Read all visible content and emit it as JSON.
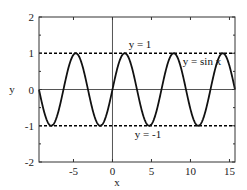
{
  "chart_data": {
    "type": "line",
    "title": "",
    "xlabel": "x",
    "ylabel": "y",
    "xlim": [
      -9.42,
      15.71
    ],
    "ylim": [
      -2,
      2
    ],
    "xticks": [
      -5,
      0,
      5,
      10,
      15
    ],
    "yticks": [
      -2,
      -1,
      0,
      1,
      2
    ],
    "grid": false,
    "series": [
      {
        "name": "y = sin x",
        "function": "sin(x)",
        "style": "solid",
        "color": "#000000"
      },
      {
        "name": "y = 1",
        "function": "1",
        "style": "dashed",
        "color": "#000000"
      },
      {
        "name": "y = -1",
        "function": "-1",
        "style": "dashed",
        "color": "#000000"
      }
    ],
    "annotations": [
      {
        "text": "y = 1",
        "x": 3.5,
        "y": 1.15
      },
      {
        "text": "y = sin x",
        "x": 10.3,
        "y": 0.75
      },
      {
        "text": "y = -1",
        "x": 4.6,
        "y": -1.25
      }
    ],
    "reference_lines": [
      {
        "axis": "x",
        "value": 0
      },
      {
        "axis": "y",
        "value": 0
      }
    ]
  },
  "labels": {
    "xlabel": "x",
    "ylabel": "y",
    "xticks": [
      "-5",
      "0",
      "5",
      "10",
      "15"
    ],
    "yticks": [
      "2",
      "1",
      "0",
      "-1",
      "-2"
    ],
    "ann_y1": "y = 1",
    "ann_sin": "y = sin x",
    "ann_ym1": "y = -1"
  }
}
